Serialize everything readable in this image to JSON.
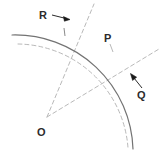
{
  "figure": {
    "background_color": "#ffffff",
    "width": 162,
    "height": 153,
    "stroke_color_solid": "#6e6e6e",
    "stroke_color_dashed": "#b0b0b0",
    "label_color": "#2b2b2b",
    "arrow_color": "#1a1a1a"
  },
  "labels": {
    "R": "R",
    "P": "P",
    "Q": "Q",
    "O": "O"
  },
  "geometry": {
    "center": {
      "name": "O",
      "x": 47,
      "y": 117
    },
    "solid_arc": {
      "name": "primary-arc",
      "radius": 118,
      "start_point": {
        "x": 12,
        "y": 34
      },
      "end_point": {
        "x": 133,
        "y": 149
      },
      "style": "solid"
    },
    "dashed_arc": {
      "name": "secondary-arc",
      "radius": 112,
      "style": "dashed"
    },
    "radius_line_R": {
      "name": "radius-to-R",
      "from": {
        "x": 47,
        "y": 117
      },
      "to": {
        "x": 94,
        "y": 4
      },
      "style": "dashed"
    },
    "radius_line_Q": {
      "name": "radius-to-Q",
      "from": {
        "x": 47,
        "y": 117
      },
      "to": {
        "x": 158,
        "y": 49
      },
      "style": "dashed"
    },
    "tick_R": {
      "x": 64,
      "y": 31
    },
    "tick_P": {
      "x": 111,
      "y": 48
    }
  },
  "annotations": [
    {
      "name": "arrow-to-R",
      "label": "R",
      "from": {
        "x": 51,
        "y": 15
      },
      "to": {
        "x": 69,
        "y": 19
      },
      "direction": "right"
    },
    {
      "name": "arrow-to-Q",
      "label": "Q",
      "from": {
        "x": 143,
        "y": 88
      },
      "to": {
        "x": 131,
        "y": 74
      },
      "direction": "up-left"
    }
  ]
}
